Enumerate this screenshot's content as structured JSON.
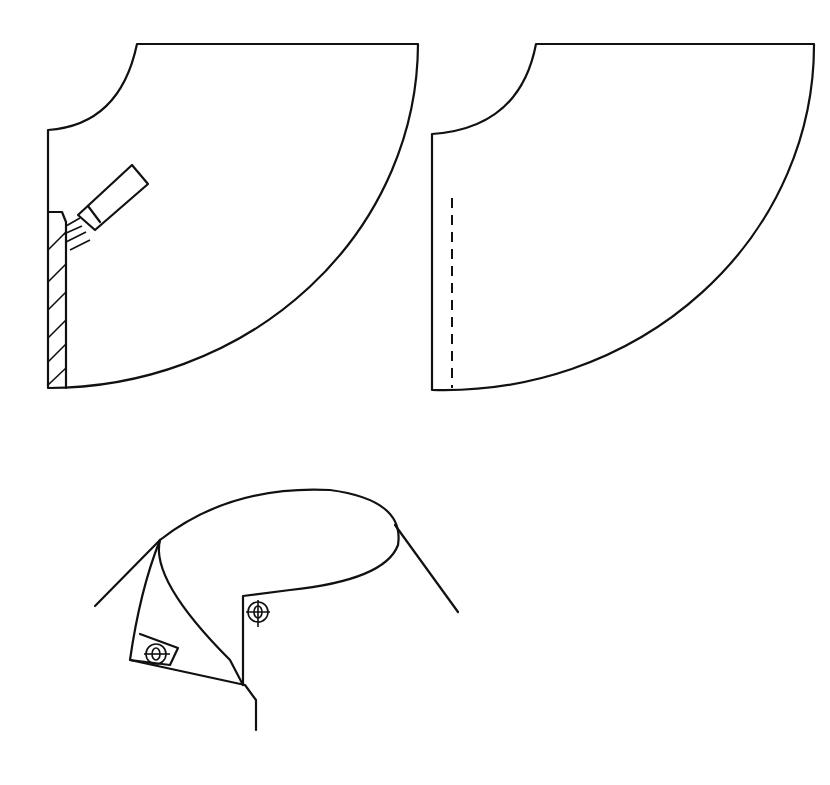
{
  "figure": {
    "panels": [
      {
        "id": "collar-piece-with-glue-brush",
        "label": ""
      },
      {
        "id": "collar-piece-with-stitch-line",
        "label": ""
      },
      {
        "id": "finished-collar-with-buttons",
        "label": ""
      }
    ],
    "colors": {
      "ink": "#111111",
      "background": "#ffffff"
    }
  }
}
